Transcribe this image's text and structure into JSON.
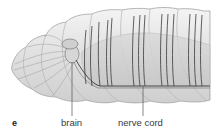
{
  "figure": {
    "panel_letter": "e",
    "labels": [
      {
        "text": "brain",
        "x": 62,
        "line_x": 72
      },
      {
        "text": "nerve cord",
        "x": 118,
        "line_x": 143
      }
    ],
    "colors": {
      "body": "#e6e6e6",
      "body_edge": "#9a9a9a",
      "gut": "#d2d2d2",
      "nerve": "#3c3c3c",
      "leader_line": "#555555",
      "label_text": "#3a3a3a"
    }
  }
}
